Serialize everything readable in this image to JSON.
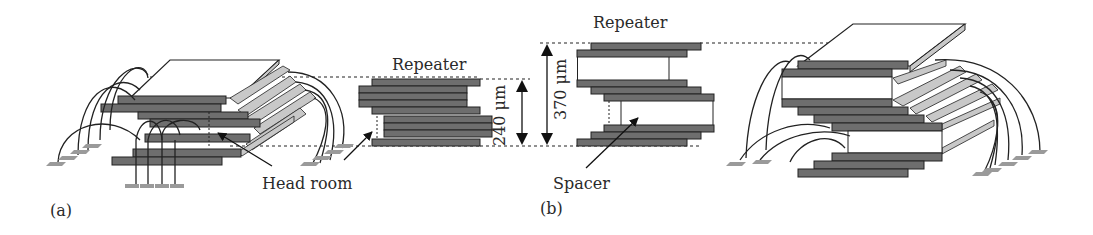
{
  "figure": {
    "panels": [
      {
        "id": "a",
        "label": "(a)"
      },
      {
        "id": "b",
        "label": "(b)"
      }
    ],
    "labels": {
      "repeater_a": "Repeater",
      "repeater_b": "Repeater",
      "head_room": "Head room",
      "spacer": "Spacer",
      "dim_240": "240 μm",
      "dim_370": "370 μm"
    },
    "colors": {
      "die": "#6e6e6e",
      "die_edge": "#2a2a2a",
      "side_face": "#c8c8c8",
      "wire": "#222222",
      "pad": "#9a9a9a",
      "background": "#ffffff"
    }
  }
}
